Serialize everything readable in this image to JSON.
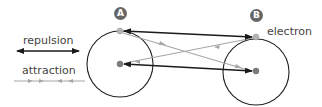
{
  "legend": {
    "repulsion_label": "repulsion",
    "attraction_label": "attraction"
  },
  "atoms": [
    {
      "badge": "A"
    },
    {
      "badge": "B"
    }
  ],
  "labels": {
    "electron": "electron"
  },
  "colors": {
    "repulsion": "#1a1a1a",
    "attraction": "#a6a6a6",
    "circle": "#222222",
    "badge": "#666666",
    "particle": "#b3b3b3",
    "nucleus": "#7a7a7a"
  }
}
